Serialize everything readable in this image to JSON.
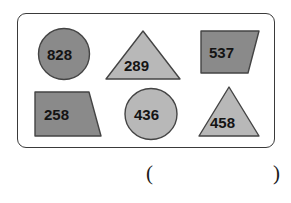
{
  "worksheet": {
    "title": "Shapes with numbers exercise",
    "border_color": "#3a3a3a",
    "background_color": "#ffffff",
    "fill_dark": "#8a8a8a",
    "fill_light": "#b8b8b8",
    "outline_color": "#444444",
    "text_color": "#141414"
  },
  "shapes": [
    {
      "id": "shape-circle-828",
      "kind": "circle",
      "value": "828",
      "fill": "#8a8a8a",
      "row": 1,
      "column": 1
    },
    {
      "id": "shape-triangle-289",
      "kind": "triangle",
      "value": "289",
      "fill": "#b8b8b8",
      "row": 1,
      "column": 2
    },
    {
      "id": "shape-trapezoid-537",
      "kind": "trapezoid",
      "value": "537",
      "fill": "#8a8a8a",
      "row": 1,
      "column": 3
    },
    {
      "id": "shape-trapezoid-258",
      "kind": "trapezoid",
      "value": "258",
      "fill": "#8a8a8a",
      "row": 2,
      "column": 1
    },
    {
      "id": "shape-circle-436",
      "kind": "circle",
      "value": "436",
      "fill": "#b8b8b8",
      "row": 2,
      "column": 2
    },
    {
      "id": "shape-triangle-458",
      "kind": "triangle",
      "value": "458",
      "fill": "#b8b8b8",
      "row": 2,
      "column": 3
    }
  ],
  "answer": {
    "open_paren": "(",
    "close_paren": ")",
    "value": ""
  }
}
